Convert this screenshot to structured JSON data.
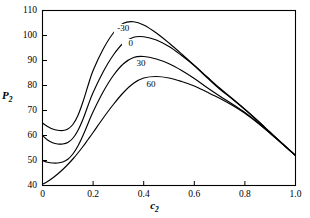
{
  "chart_data": {
    "type": "line",
    "title": "",
    "xlabel": "c2",
    "ylabel": "P2",
    "xlabel_display": "c",
    "xlabel_sub": "2",
    "ylabel_display": "P",
    "ylabel_sub": "2",
    "xlim": [
      0,
      1.0
    ],
    "ylim": [
      40,
      110
    ],
    "xticks": [
      "0",
      "0.2",
      "0.4",
      "0.6",
      "0.8",
      "1.0"
    ],
    "xtickvals": [
      0,
      0.2,
      0.4,
      0.6,
      0.8,
      1.0
    ],
    "yticks": [
      "40",
      "50",
      "60",
      "70",
      "80",
      "90",
      "100",
      "110"
    ],
    "ytickvals": [
      40,
      50,
      60,
      70,
      80,
      90,
      100,
      110
    ],
    "grid": false,
    "legend": "inline-curve-labels",
    "line_color": "#000000",
    "frame_color": "#000000",
    "series": [
      {
        "name": "-30",
        "label": "-30",
        "label_x": 0.315,
        "label_y": 102.5,
        "x": [
          0.0,
          0.02,
          0.04,
          0.06,
          0.08,
          0.1,
          0.12,
          0.14,
          0.16,
          0.18,
          0.2,
          0.24,
          0.28,
          0.32,
          0.36,
          0.4,
          0.45,
          0.5,
          0.55,
          0.6,
          0.65,
          0.7,
          0.75,
          0.8,
          0.85,
          0.9,
          0.95,
          1.0
        ],
        "y": [
          65.0,
          63.6,
          62.6,
          62.1,
          62.0,
          62.6,
          64.4,
          68.0,
          73.5,
          80.0,
          86.0,
          94.6,
          101.0,
          104.9,
          105.5,
          104.2,
          101.0,
          97.0,
          92.6,
          88.0,
          83.2,
          78.6,
          74.6,
          70.4,
          65.9,
          61.2,
          56.5,
          52.0
        ]
      },
      {
        "name": "0",
        "label": "0",
        "label_x": 0.345,
        "label_y": 96.5,
        "x": [
          0.0,
          0.02,
          0.04,
          0.06,
          0.08,
          0.1,
          0.12,
          0.14,
          0.16,
          0.18,
          0.2,
          0.24,
          0.28,
          0.32,
          0.36,
          0.4,
          0.45,
          0.5,
          0.55,
          0.6,
          0.65,
          0.7,
          0.75,
          0.8,
          0.85,
          0.9,
          0.95,
          1.0
        ],
        "y": [
          60.0,
          58.2,
          57.1,
          56.6,
          56.6,
          57.2,
          58.9,
          62.0,
          66.5,
          72.0,
          77.2,
          85.5,
          92.2,
          97.0,
          99.3,
          99.5,
          98.2,
          95.6,
          92.0,
          88.0,
          83.5,
          79.0,
          74.8,
          70.5,
          66.0,
          61.3,
          56.6,
          52.0
        ]
      },
      {
        "name": "30",
        "label": "30",
        "label_x": 0.385,
        "label_y": 88.5,
        "x": [
          0.0,
          0.02,
          0.04,
          0.06,
          0.08,
          0.1,
          0.12,
          0.14,
          0.16,
          0.18,
          0.2,
          0.24,
          0.28,
          0.32,
          0.36,
          0.4,
          0.45,
          0.5,
          0.55,
          0.6,
          0.65,
          0.7,
          0.75,
          0.8,
          0.85,
          0.9,
          0.95,
          1.0
        ],
        "y": [
          50.0,
          49.3,
          49.0,
          49.0,
          49.4,
          50.5,
          52.6,
          55.8,
          60.0,
          64.8,
          69.5,
          77.5,
          84.0,
          88.7,
          91.2,
          91.6,
          90.6,
          88.7,
          86.0,
          82.8,
          79.2,
          75.8,
          72.6,
          69.2,
          65.2,
          60.9,
          56.5,
          52.0
        ]
      },
      {
        "name": "60",
        "label": "60",
        "label_x": 0.425,
        "label_y": 80.3,
        "x": [
          0.0,
          0.02,
          0.04,
          0.06,
          0.08,
          0.1,
          0.12,
          0.14,
          0.16,
          0.18,
          0.2,
          0.24,
          0.28,
          0.32,
          0.36,
          0.4,
          0.45,
          0.5,
          0.55,
          0.6,
          0.65,
          0.7,
          0.75,
          0.8,
          0.85,
          0.9,
          0.95,
          1.0
        ],
        "y": [
          40.5,
          41.6,
          43.0,
          44.6,
          46.4,
          48.4,
          50.6,
          53.0,
          55.6,
          58.4,
          61.2,
          67.0,
          72.4,
          77.2,
          80.9,
          83.0,
          83.6,
          83.0,
          81.6,
          79.8,
          77.4,
          74.9,
          72.1,
          68.9,
          65.1,
          60.9,
          56.5,
          52.0
        ]
      }
    ]
  }
}
